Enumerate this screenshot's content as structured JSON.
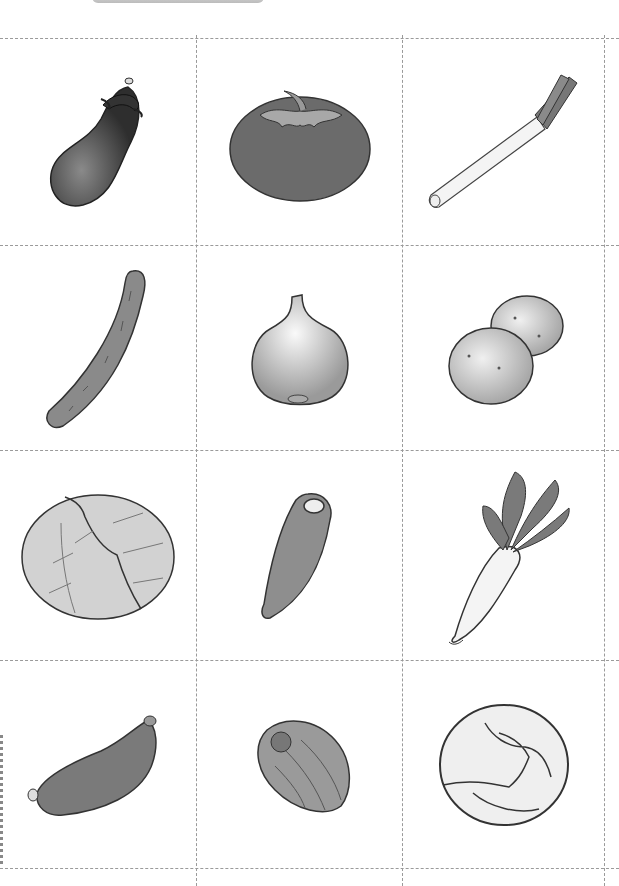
{
  "sheet": {
    "type": "vegetable-cards",
    "columns": 3,
    "rows": 4,
    "cut_line_color": "#9a9a9a",
    "tab_color": "#c8c8c8"
  },
  "cards": [
    {
      "row": 0,
      "col": 0,
      "name": "eggplant",
      "icon": "eggplant-icon",
      "fill": "#4a4a4a"
    },
    {
      "row": 0,
      "col": 1,
      "name": "tomato",
      "icon": "tomato-icon",
      "fill": "#6b6b6b"
    },
    {
      "row": 0,
      "col": 2,
      "name": "green onion",
      "icon": "green-onion-icon",
      "fill": "#f4f4f4"
    },
    {
      "row": 1,
      "col": 0,
      "name": "cucumber",
      "icon": "cucumber-icon",
      "fill": "#8a8a8a"
    },
    {
      "row": 1,
      "col": 1,
      "name": "onion",
      "icon": "onion-icon",
      "fill": "#d6d6d6"
    },
    {
      "row": 1,
      "col": 2,
      "name": "potato",
      "icon": "potato-icon",
      "fill": "#d0d0d0"
    },
    {
      "row": 2,
      "col": 0,
      "name": "cabbage",
      "icon": "cabbage-icon",
      "fill": "#cfcfcf"
    },
    {
      "row": 2,
      "col": 1,
      "name": "carrot",
      "icon": "carrot-icon",
      "fill": "#8e8e8e"
    },
    {
      "row": 2,
      "col": 2,
      "name": "daikon radish",
      "icon": "daikon-icon",
      "fill": "#f2f2f2"
    },
    {
      "row": 3,
      "col": 0,
      "name": "sweet potato",
      "icon": "sweet-potato-icon",
      "fill": "#7a7a7a"
    },
    {
      "row": 3,
      "col": 1,
      "name": "bell pepper",
      "icon": "bell-pepper-icon",
      "fill": "#9a9a9a"
    },
    {
      "row": 3,
      "col": 2,
      "name": "lettuce",
      "icon": "lettuce-icon",
      "fill": "#eeeeee"
    }
  ]
}
